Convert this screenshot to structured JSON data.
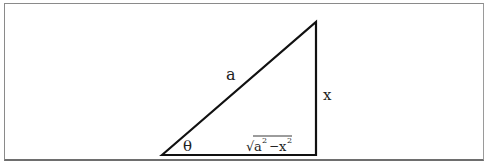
{
  "diagram": {
    "type": "right-triangle",
    "labels": {
      "hypotenuse": "a",
      "opposite": "x",
      "angle": "θ",
      "adjacent_radicand_a": "a",
      "adjacent_exp_a": "2",
      "adjacent_minus": "−",
      "adjacent_radicand_x": "x",
      "adjacent_exp_x": "2",
      "adjacent_sqrt": "√"
    },
    "vertices": {
      "angle_vertex": [
        162,
        155
      ],
      "top_vertex": [
        316,
        22
      ],
      "right_angle_vertex": [
        316,
        155
      ]
    },
    "colors": {
      "line": "#111111",
      "frame": "#8a8a8a"
    }
  }
}
